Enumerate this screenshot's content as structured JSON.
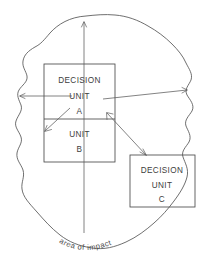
{
  "figure": {
    "caption": "area of impact",
    "stroke_color": "#4a4a4a",
    "background_color": "#ffffff"
  },
  "boxes": [
    {
      "id": "decision-unit-a",
      "lines": [
        "DECISION",
        "UNIT",
        "A"
      ],
      "line1": "DECISION",
      "line2": "UNIT",
      "line3": "A"
    },
    {
      "id": "unit-b",
      "lines": [
        "UNIT",
        "B"
      ],
      "line1": "UNIT",
      "line2": "B"
    },
    {
      "id": "decision-unit-c",
      "lines": [
        "DECISION",
        "UNIT",
        "C"
      ],
      "line1": "DECISION",
      "line2": "UNIT",
      "line3": "C"
    }
  ],
  "caption": {
    "text": "area of impact",
    "letters": [
      "a",
      "r",
      "e",
      "a",
      "o",
      "f",
      "i",
      "m",
      "p",
      "a",
      "c",
      "t"
    ]
  },
  "connectors": [
    {
      "id": "arrow-up-from-units",
      "direction": "up"
    },
    {
      "id": "arrow-left-into-unit-a",
      "direction": "left"
    },
    {
      "id": "arrow-right-from-unit-a",
      "direction": "right"
    },
    {
      "id": "arrow-diagonal-into-unit-b",
      "direction": "down-left"
    },
    {
      "id": "arrow-diagonal-unit-a-to-unit-c",
      "direction": "down-right"
    },
    {
      "id": "arrow-down-from-unit-b",
      "direction": "down"
    }
  ]
}
